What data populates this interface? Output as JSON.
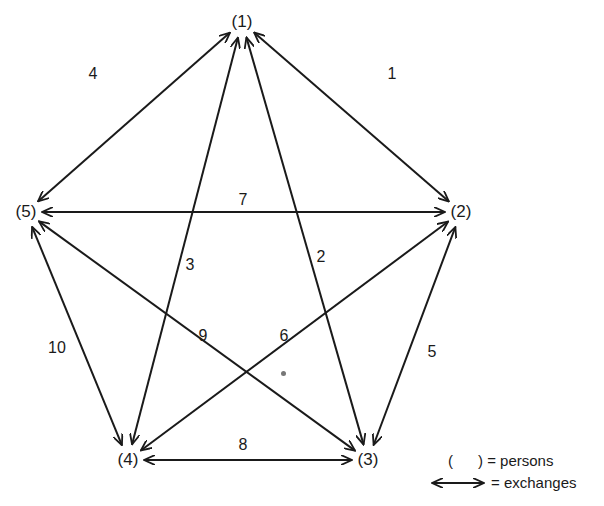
{
  "diagram": {
    "type": "complete-graph-exchange-network",
    "nodes": [
      {
        "id": "1",
        "label": "(1)",
        "x": 242,
        "y": 22
      },
      {
        "id": "2",
        "label": "(2)",
        "x": 461,
        "y": 212
      },
      {
        "id": "3",
        "label": "(3)",
        "x": 368,
        "y": 460
      },
      {
        "id": "4",
        "label": "(4)",
        "x": 128,
        "y": 460
      },
      {
        "id": "5",
        "label": "(5)",
        "x": 26,
        "y": 212
      }
    ],
    "edges": [
      {
        "id": "1",
        "label": "1",
        "from": "1",
        "to": "2",
        "lx": 392,
        "ly": 74
      },
      {
        "id": "2",
        "label": "2",
        "from": "1",
        "to": "3",
        "lx": 321,
        "ly": 257
      },
      {
        "id": "3",
        "label": "3",
        "from": "1",
        "to": "4",
        "lx": 190,
        "ly": 265
      },
      {
        "id": "4",
        "label": "4",
        "from": "1",
        "to": "5",
        "lx": 93,
        "ly": 74
      },
      {
        "id": "5",
        "label": "5",
        "from": "2",
        "to": "3",
        "lx": 432,
        "ly": 352
      },
      {
        "id": "6",
        "label": "6",
        "from": "2",
        "to": "4",
        "lx": 284,
        "ly": 336
      },
      {
        "id": "7",
        "label": "7",
        "from": "2",
        "to": "5",
        "lx": 243,
        "ly": 200
      },
      {
        "id": "8",
        "label": "8",
        "from": "3",
        "to": "4",
        "lx": 243,
        "ly": 445
      },
      {
        "id": "9",
        "label": "9",
        "from": "3",
        "to": "5",
        "lx": 203,
        "ly": 336
      },
      {
        "id": "10",
        "label": "10",
        "from": "4",
        "to": "5",
        "lx": 57,
        "ly": 348
      }
    ]
  },
  "legend": {
    "persons_symbol": "(      )",
    "persons_label": "= persons",
    "exchanges_label": "= exchanges"
  }
}
